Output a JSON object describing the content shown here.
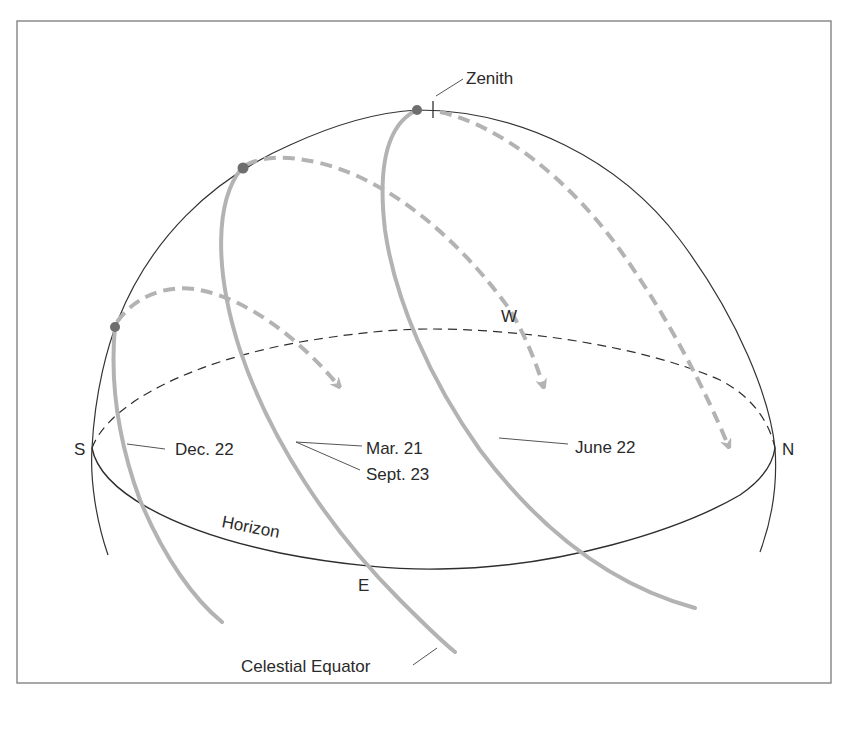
{
  "figure": {
    "type": "celestial-sphere-sun-paths",
    "colors": {
      "background": "#ffffff",
      "frame": "#7a7a7a",
      "sphere_outline": "#333333",
      "horizon": "#2e2e2e",
      "sun_path": "#b3b3b3",
      "sun_path_dashed": "#b3b3b3",
      "noon_marker": "#6e6e6e",
      "text": "#2a2a2a"
    },
    "labels": {
      "zenith": "Zenith",
      "west": "W",
      "south": "S",
      "north": "N",
      "east": "E",
      "horizon": "Horizon",
      "celestial_equator": "Celestial Equator"
    },
    "sun_paths": [
      {
        "id": "winter-solstice",
        "label": "Dec. 22"
      },
      {
        "id": "equinox",
        "label": "Mar. 21",
        "label2": "Sept. 23"
      },
      {
        "id": "summer-solstice",
        "label": "June 22"
      }
    ]
  }
}
